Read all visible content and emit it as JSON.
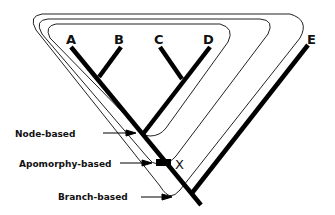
{
  "diagram": {
    "type": "cladogram",
    "taxa": [
      {
        "id": "A",
        "label": "A"
      },
      {
        "id": "B",
        "label": "B"
      },
      {
        "id": "C",
        "label": "C"
      },
      {
        "id": "D",
        "label": "D"
      },
      {
        "id": "E",
        "label": "E"
      }
    ],
    "apomorphy_marker": {
      "label": "X"
    },
    "definitions": [
      {
        "id": "node",
        "label": "Node-based"
      },
      {
        "id": "apomorphy",
        "label": "Apomorphy-based"
      },
      {
        "id": "branch",
        "label": "Branch-based"
      }
    ],
    "colors": {
      "line": "#000000",
      "background": "#ffffff"
    }
  }
}
